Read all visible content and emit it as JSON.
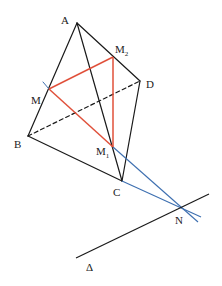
{
  "diagram": {
    "type": "geometry-tetrahedron",
    "colors": {
      "edge": "#1a1a1a",
      "section": "#e0503a",
      "construction": "#3d6fb0"
    },
    "points": {
      "A": {
        "label": "A",
        "x": 77,
        "y": 23
      },
      "B": {
        "label": "B",
        "x": 28,
        "y": 136
      },
      "C": {
        "label": "C",
        "x": 122,
        "y": 181
      },
      "D": {
        "label": "D",
        "x": 140,
        "y": 81
      },
      "M": {
        "label": "M",
        "x": 49,
        "y": 89
      },
      "M1": {
        "label": "M",
        "sub": "1",
        "x": 113,
        "y": 147
      },
      "M2": {
        "label": "M",
        "sub": "2",
        "x": 113,
        "y": 57
      },
      "N": {
        "label": "N",
        "x": 181,
        "y": 208
      }
    },
    "line_delta": {
      "label": "Δ"
    },
    "edges": [
      {
        "from": "A",
        "to": "B",
        "style": "solid",
        "color": "edge"
      },
      {
        "from": "A",
        "to": "C",
        "style": "solid",
        "color": "edge"
      },
      {
        "from": "A",
        "to": "D",
        "style": "solid",
        "color": "edge"
      },
      {
        "from": "B",
        "to": "C",
        "style": "solid",
        "color": "edge"
      },
      {
        "from": "C",
        "to": "D",
        "style": "solid",
        "color": "edge"
      },
      {
        "from": "B",
        "to": "D",
        "style": "dashed",
        "color": "edge"
      }
    ],
    "section_triangle": [
      "M",
      "M1",
      "M2"
    ],
    "construction_lines": [
      {
        "from": "M1",
        "through": "N"
      },
      {
        "from": "C",
        "through": "N"
      }
    ]
  }
}
